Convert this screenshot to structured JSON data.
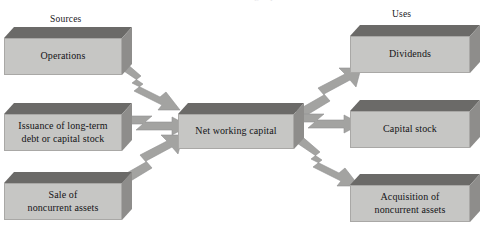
{
  "diagram": {
    "title_crop": "Exhibit  ·  Sources and uses of net working capital",
    "headings": {
      "sources": "Sources",
      "uses": "Uses"
    },
    "center": {
      "label": "Net working capital"
    },
    "sources": [
      {
        "id": "operations",
        "lines": [
          "Operations"
        ]
      },
      {
        "id": "issuance",
        "lines": [
          "Issuance of long-term",
          "debt or capital stock"
        ]
      },
      {
        "id": "sale-noncurrent",
        "lines": [
          "Sale of",
          "noncurrent assets"
        ]
      }
    ],
    "uses": [
      {
        "id": "dividends",
        "lines": [
          "Dividends"
        ]
      },
      {
        "id": "capital-stock",
        "lines": [
          "Capital stock"
        ]
      },
      {
        "id": "acquisition-noncurrent",
        "lines": [
          "Acquisition of",
          "noncurrent assets"
        ]
      }
    ],
    "arrows": [
      {
        "id": "operations-to-center",
        "from": "operations",
        "to": "center",
        "direction": "down-right"
      },
      {
        "id": "issuance-to-center",
        "from": "issuance",
        "to": "center",
        "direction": "right"
      },
      {
        "id": "sale-to-center",
        "from": "sale-noncurrent",
        "to": "center",
        "direction": "up-right"
      },
      {
        "id": "center-to-dividends",
        "from": "center",
        "to": "dividends",
        "direction": "up-right"
      },
      {
        "id": "center-to-capital-stock",
        "from": "center",
        "to": "capital-stock",
        "direction": "right"
      },
      {
        "id": "center-to-acquisition",
        "from": "center",
        "to": "acquisition-noncurrent",
        "direction": "down-right"
      }
    ],
    "colors": {
      "box_front": "#c6c6c4",
      "box_top": "#6b6a68",
      "box_side": "#8e8d8b",
      "arrow_fill": "#a3a3a1",
      "arrow_stroke": "#8a8a88",
      "text": "#141417",
      "background": "#ffffff"
    }
  }
}
